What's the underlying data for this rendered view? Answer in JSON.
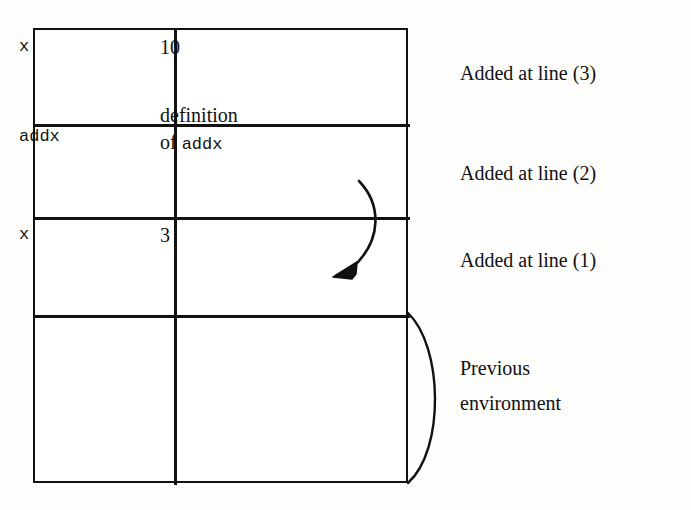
{
  "diagram": {
    "table": {
      "rows": [
        {
          "name": "x",
          "value": "10",
          "value_extra": ""
        },
        {
          "name": "addx",
          "value": "definition",
          "value_extra": "of addx",
          "value_extra_mono": "addx",
          "value_extra_prefix": "of "
        },
        {
          "name": "x",
          "value": "3",
          "value_extra": ""
        },
        {
          "name": "",
          "value": "",
          "value_extra": ""
        }
      ]
    },
    "annotations": [
      {
        "id": "added-line-3",
        "text": "Added at line (3)"
      },
      {
        "id": "added-line-2",
        "text": "Added at line (2)"
      },
      {
        "id": "added-line-1",
        "text": "Added at line (1)"
      },
      {
        "id": "previous-environment",
        "text": "Previous\nenvironment"
      }
    ],
    "arrow": {
      "name": "curved-pointer-arrow",
      "from": "definition of addx",
      "to": "x = 3 binding"
    },
    "brace": {
      "name": "previous-environment-brace",
      "spans": "bottom empty row"
    },
    "colors": {
      "ink": "#111111",
      "paper": "#fdfdfb",
      "cell_fill": "#ffffff"
    }
  }
}
